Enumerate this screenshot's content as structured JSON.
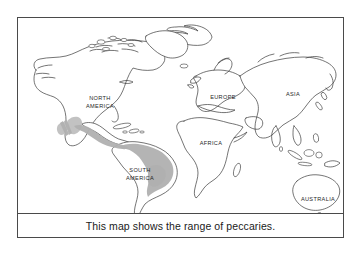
{
  "figure": {
    "type": "world-map",
    "caption": "This map shows the range of peccaries.",
    "subject": "range of peccaries",
    "frame_color": "#4a4a4a",
    "background_color": "#ffffff"
  },
  "map": {
    "projection": "world-flat",
    "coastline_color": "#3a3a3a",
    "land_fill": "#ffffff",
    "range_shading_color": "#b0b0b0",
    "continent_labels": [
      {
        "name": "north-america",
        "label": "NORTH\nAMERICA",
        "line1": "NORTH",
        "line2": "AMERICA",
        "x": 82,
        "y": 84
      },
      {
        "name": "south-america",
        "label": "SOUTH\nAMERICA",
        "line1": "SOUTH",
        "line2": "AMERICA",
        "x": 122,
        "y": 157
      },
      {
        "name": "europe",
        "label": "EUROPE",
        "line1": "EUROPE",
        "line2": "",
        "x": 205,
        "y": 80
      },
      {
        "name": "asia",
        "label": "ASIA",
        "line1": "ASIA",
        "line2": "",
        "x": 275,
        "y": 77
      },
      {
        "name": "africa",
        "label": "AFRICA",
        "line1": "AFRICA",
        "line2": "",
        "x": 193,
        "y": 126
      },
      {
        "name": "australia",
        "label": "AUSTRALIA",
        "line1": "AUSTRALIA",
        "line2": "",
        "x": 300,
        "y": 182
      }
    ],
    "range_regions": [
      {
        "name": "southwest-north-america",
        "description": "Shaded range in southwestern North America"
      },
      {
        "name": "mexico-central-america",
        "description": "Shaded range through Mexico and Central America"
      },
      {
        "name": "south-america-main",
        "description": "Shaded range across most of South America except the southern cone"
      }
    ]
  }
}
